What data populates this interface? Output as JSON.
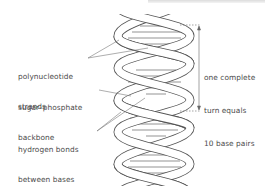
{
  "diagram": {
    "labels": {
      "strands": {
        "line1": "polynucleotide",
        "line2": "strands"
      },
      "backbone": {
        "line1": "sugar–phosphate",
        "line2": "backbone"
      },
      "hbonds": {
        "line1": "hydrogen bonds",
        "line2": "between bases"
      },
      "turn": {
        "line1": "one complete",
        "line2": "turn equals",
        "line3": "10 base pairs"
      }
    },
    "colors": {
      "stroke": "#555555",
      "text": "#4a4a4a",
      "ribbon_fill": "#ffffff"
    }
  }
}
